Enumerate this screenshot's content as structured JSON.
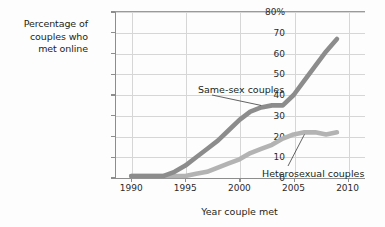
{
  "chart_data": {
    "type": "line",
    "title": "",
    "xlabel": "Year couple met",
    "ylabel": "Percentage of couples who met online",
    "ylabel_lines": [
      "Percentage of",
      "couples who",
      "met online"
    ],
    "xlim": [
      1988.5,
      2011.5
    ],
    "ylim": [
      0,
      80
    ],
    "grid": true,
    "legend_position": "inline-annotations",
    "xticks": [
      "1990",
      "1995",
      "2000",
      "2005",
      "2010"
    ],
    "xtick_values": [
      1990,
      1995,
      2000,
      2005,
      2010
    ],
    "yticks": [
      "0",
      "10",
      "20",
      "30",
      "40",
      "50",
      "60",
      "70",
      "80%"
    ],
    "ytick_values": [
      0,
      10,
      20,
      30,
      40,
      50,
      60,
      70,
      80
    ],
    "x": [
      1990,
      1991,
      1992,
      1993,
      1994,
      1995,
      1996,
      1997,
      1998,
      1999,
      2000,
      2001,
      2002,
      2003,
      2004,
      2005,
      2006,
      2007,
      2008,
      2009
    ],
    "series": [
      {
        "name": "Same-sex couples",
        "color": "#8c8c8c",
        "values": [
          1,
          1,
          1,
          1,
          3,
          6,
          10,
          14,
          18,
          23,
          28,
          32,
          34,
          35,
          35,
          40,
          47,
          54,
          61,
          67
        ]
      },
      {
        "name": "Heterosexual couples",
        "color": "#b3b3b3",
        "values": [
          1,
          1,
          1,
          1,
          1,
          1,
          2,
          3,
          5,
          7,
          9,
          12,
          14,
          16,
          19,
          21,
          22,
          22,
          21,
          22
        ]
      }
    ],
    "annotations": [
      {
        "text": "Same-sex couples",
        "target_x": 2002,
        "target_y": 34
      },
      {
        "text": "Heterosexual couples",
        "target_x": 2006,
        "target_y": 22
      }
    ]
  },
  "axis": {
    "y_title_lines": [
      "Percentage of",
      "couples who",
      "met online"
    ],
    "x_title": "Year couple met"
  },
  "colors": {
    "same_sex_line": "#8c8c8c",
    "heterosexual_line": "#b3b3b3",
    "grid": "#d6d6d6",
    "axis": "#8d8d8d",
    "text": "#231f20",
    "background": "#fdfdfd"
  }
}
